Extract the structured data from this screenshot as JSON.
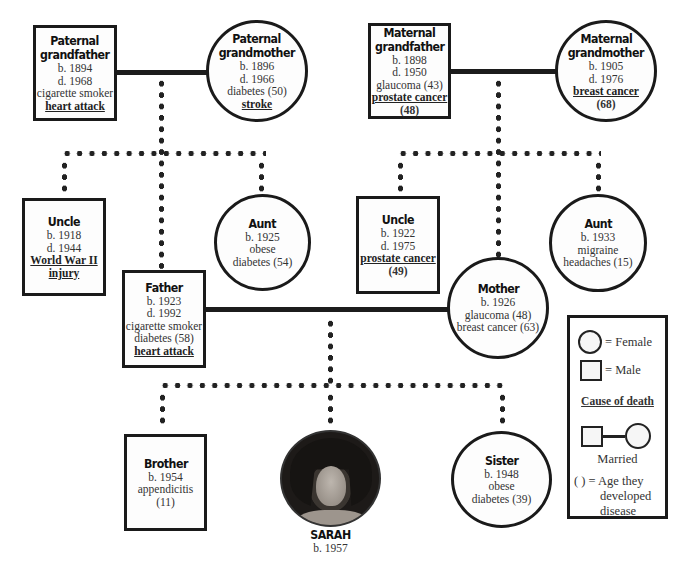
{
  "chart": {
    "subject": "SARAH"
  },
  "people": {
    "paternal_grandfather": {
      "title_1": "Paternal",
      "title_2": "grandfather",
      "born": "b. 1894",
      "died": "d. 1968",
      "note": "cigarette smoker",
      "cause": "heart attack",
      "sex": "male"
    },
    "paternal_grandmother": {
      "title_1": "Paternal",
      "title_2": "grandmother",
      "born": "b. 1896",
      "died": "d. 1966",
      "note": "diabetes (50)",
      "cause": "stroke",
      "sex": "female"
    },
    "maternal_grandfather": {
      "title_1": "Maternal",
      "title_2": "grandfather",
      "born": "b. 1898",
      "died": "d. 1950",
      "note": "glaucoma (43)",
      "cause": "prostate cancer",
      "cause_age": "(48)",
      "sex": "male"
    },
    "maternal_grandmother": {
      "title_1": "Maternal",
      "title_2": "grandmother",
      "born": "b. 1905",
      "died": "d. 1976",
      "cause": "breast cancer",
      "cause_age": "(68)",
      "sex": "female"
    },
    "paternal_uncle": {
      "title": "Uncle",
      "born": "b. 1918",
      "died": "d. 1944",
      "cause_1": "World War II",
      "cause_2": "injury",
      "sex": "male"
    },
    "paternal_aunt": {
      "title": "Aunt",
      "born": "b. 1925",
      "note_1": "obese",
      "note_2": "diabetes (54)",
      "sex": "female"
    },
    "father": {
      "title": "Father",
      "born": "b. 1923",
      "died": "d. 1992",
      "note_1": "cigarette smoker",
      "note_2": "diabetes (58)",
      "cause": "heart attack",
      "sex": "male"
    },
    "maternal_uncle": {
      "title": "Uncle",
      "born": "b. 1922",
      "died": "d. 1975",
      "cause": "prostate cancer",
      "cause_age": "(49)",
      "sex": "male"
    },
    "maternal_aunt": {
      "title": "Aunt",
      "born": "b. 1933",
      "note_1": "migraine",
      "note_2": "headaches (15)",
      "sex": "female"
    },
    "mother": {
      "title": "Mother",
      "born": "b. 1926",
      "note_1": "glaucoma (48)",
      "note_2": "breast cancer (63)",
      "sex": "female"
    },
    "brother": {
      "title": "Brother",
      "born": "b. 1954",
      "note_1": "appendicitis",
      "note_2": "(11)",
      "sex": "male"
    },
    "sarah": {
      "title": "SARAH",
      "born": "b. 1957",
      "sex": "female",
      "photo": "portrait-photo"
    },
    "sister": {
      "title": "Sister",
      "born": "b. 1948",
      "note_1": "obese",
      "note_2": "diabetes (39)",
      "sex": "female"
    }
  },
  "legend": {
    "female": "= Female",
    "male": "= Male",
    "cause_of_death": "Cause of death",
    "married": "Married",
    "age_1": "( ) = Age they",
    "age_2": "developed",
    "age_3": "disease"
  },
  "colors": {
    "line": "#1c1c1c",
    "node_fill": "#fdfdfd",
    "text": "#222222"
  }
}
